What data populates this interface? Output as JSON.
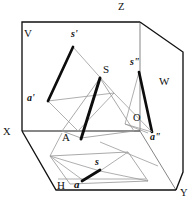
{
  "figure": {
    "type": "descriptive-geometry-three-plane-projection",
    "caption": "Three-plane orthographic projection of a pyramid with apex S and base vertex A",
    "background_color": "#ffffff",
    "line_color": "#111111",
    "thin_line_color": "#8a8a8a",
    "bold_stroke_width": 2.6,
    "frame_stroke_width": 1.3,
    "thin_stroke_width": 0.75
  },
  "axes": [
    {
      "id": "z",
      "label": "Z",
      "x": 120,
      "y": 4
    },
    {
      "id": "x",
      "label": "X",
      "x": 3,
      "y": 134
    },
    {
      "id": "y",
      "label": "Y",
      "x": 180,
      "y": 192
    },
    {
      "id": "o",
      "label": "O",
      "x": 134,
      "y": 117
    }
  ],
  "planes": [
    {
      "id": "v",
      "label": "V",
      "x": 23,
      "y": 27,
      "description": "vertical frontal projection plane"
    },
    {
      "id": "h",
      "label": "H",
      "x": 59,
      "y": 186,
      "description": "horizontal projection plane"
    },
    {
      "id": "w",
      "label": "W",
      "x": 160,
      "y": 79,
      "description": "profile side projection plane"
    }
  ],
  "points": [
    {
      "id": "s-space",
      "label": "S",
      "x": 100,
      "y": 69,
      "style": "plain",
      "description": "apex of pyramid in space"
    },
    {
      "id": "a-space",
      "label": "A",
      "x": 63,
      "y": 137,
      "style": "plain",
      "description": "base vertex of pyramid in space"
    },
    {
      "id": "s-front",
      "label": "s'",
      "x": 74,
      "y": 35,
      "style": "proj",
      "description": "frontal projection of apex S on V"
    },
    {
      "id": "a-front",
      "label": "a'",
      "x": 29,
      "y": 96,
      "style": "proj",
      "description": "frontal projection of A on V"
    },
    {
      "id": "s-side",
      "label": "s\"",
      "x": 133,
      "y": 63,
      "style": "proj",
      "description": "profile projection of apex S on W"
    },
    {
      "id": "a-side",
      "label": "a\"",
      "x": 151,
      "y": 137,
      "style": "proj",
      "description": "profile projection of A on W"
    },
    {
      "id": "s-top",
      "label": "s",
      "x": 97,
      "y": 163,
      "style": "proj",
      "description": "horizontal projection of apex S on H"
    },
    {
      "id": "a-top",
      "label": "a",
      "x": 77,
      "y": 185,
      "style": "proj",
      "description": "horizontal projection of A on H"
    }
  ],
  "geometry": {
    "v_plane_frame": "22,22 140,22 140,131 22,131",
    "h_plane_frame": "22,131 140,131 174,190 56,190",
    "w_plane_frame": "140,22 183,52 183,172 140,131",
    "z_axis": "140,22 140,131",
    "x_axis": "22,131 140,131",
    "y_axis": "140,131 174,190",
    "outer_left_edge": "22,131 56,190",
    "outer_w_top": "140,22 183,52",
    "outer_w_right": "183,52 183,172",
    "outer_y_edge": "174,190 183,172",
    "front_proj_bold_s_a": "73,47 48,101",
    "front_proj_thin_1": "73,47 113,93",
    "front_proj_thin_2": "48,101 113,93",
    "front_proj_thin_3": "48,101 77,131",
    "front_proj_thin_4": "113,93 77,131",
    "space_bold_s_a": "100,78 81,137",
    "space_thin_1": "100,78 62,131",
    "space_thin_2": "100,78 133,131",
    "space_thin_3": "62,131 133,131",
    "space_thin_4": "62,131 81,137",
    "space_thin_5": "133,131 81,137",
    "side_proj_bold": "139,72 151,131",
    "side_proj_thin_1": "139,72 126,124",
    "side_proj_thin_2": "126,124 151,131",
    "top_proj_bold": "99,170 82,180",
    "top_plane_quad": "50,156 128,152 148,180 70,184",
    "top_thin_1": "50,156 99,170",
    "top_thin_2": "128,152 99,170",
    "top_thin_3": "148,180 99,170",
    "top_thin_4": "70,184 99,170",
    "top_thin_5": "50,156 82,180",
    "ground_line_1": "56,178 148,178",
    "ground_line_2": "63,133 140,133"
  }
}
